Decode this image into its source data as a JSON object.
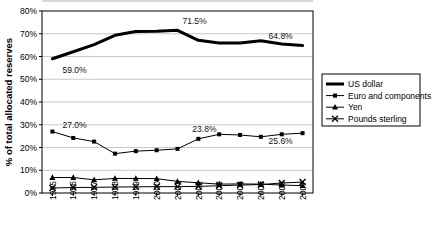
{
  "chart_data": {
    "type": "line",
    "title": "",
    "xlabel": "",
    "ylabel": "% of total allocated reserves",
    "categories": [
      "1995",
      "1996",
      "1997",
      "1998",
      "1999",
      "2000",
      "2001",
      "2002",
      "2003",
      "2004",
      "2005",
      "2006",
      "2007"
    ],
    "ylim": [
      0,
      80
    ],
    "ytick_step": 10,
    "yticks": [
      "0%",
      "10%",
      "20%",
      "30%",
      "40%",
      "50%",
      "60%",
      "70%",
      "80%"
    ],
    "grid": "horizontal",
    "legend_position": "right",
    "series": [
      {
        "name": "US dollar",
        "marker": "none",
        "line_width": 3,
        "color": "#000000",
        "values": [
          59.0,
          62.1,
          65.2,
          69.3,
          71.0,
          71.1,
          71.5,
          67.1,
          65.9,
          65.9,
          66.9,
          65.5,
          64.8
        ]
      },
      {
        "name": "Euro and components",
        "marker": "square",
        "line_width": 1,
        "color": "#000000",
        "values": [
          27.0,
          24.2,
          22.6,
          17.3,
          18.4,
          18.8,
          19.4,
          23.8,
          25.8,
          25.5,
          24.7,
          25.8,
          26.3
        ]
      },
      {
        "name": "Yen",
        "marker": "triangle",
        "line_width": 1,
        "color": "#000000",
        "values": [
          6.8,
          6.8,
          5.8,
          6.4,
          6.4,
          6.3,
          5.1,
          4.5,
          3.9,
          4.0,
          3.9,
          3.5,
          3.2
        ]
      },
      {
        "name": "Pounds sterling",
        "marker": "x",
        "line_width": 1,
        "color": "#000000",
        "values": [
          2.2,
          2.4,
          2.5,
          2.6,
          2.7,
          2.8,
          2.8,
          2.9,
          3.2,
          3.5,
          3.7,
          4.4,
          4.8
        ]
      }
    ],
    "annotations": [
      {
        "text": "59.0%",
        "series": "US dollar",
        "category": "1995",
        "dx": 10,
        "dy": 14
      },
      {
        "text": "71.5%",
        "series": "US dollar",
        "category": "2001",
        "dx": 5,
        "dy": -6
      },
      {
        "text": "64.8%",
        "series": "US dollar",
        "category": "2007",
        "dx": -34,
        "dy": -7
      },
      {
        "text": "27.0%",
        "series": "Euro and components",
        "category": "1995",
        "dx": 10,
        "dy": -4
      },
      {
        "text": "23.8%",
        "series": "Euro and components",
        "category": "2002",
        "dx": -6,
        "dy": -7
      },
      {
        "text": "25.6%",
        "series": "Euro and components",
        "category": "2007",
        "dx": -34,
        "dy": 11
      }
    ]
  },
  "legend": {
    "items": [
      {
        "label": "US dollar"
      },
      {
        "label": "Euro and components"
      },
      {
        "label": "Yen"
      },
      {
        "label": "Pounds sterling"
      }
    ]
  }
}
